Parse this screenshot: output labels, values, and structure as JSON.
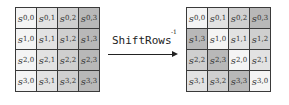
{
  "diagram": {
    "operation_label": "ShiftRows",
    "operation_superscript": "-1",
    "shades": {
      "0": "#f4f4f4",
      "1": "#e2e2e2",
      "2": "#cfcfcf",
      "3": "#b8b8b8"
    },
    "left_grid": {
      "cells": [
        [
          {
            "r": "0",
            "c": "0",
            "shade": 0
          },
          {
            "r": "0",
            "c": "1",
            "shade": 1
          },
          {
            "r": "0",
            "c": "2",
            "shade": 2
          },
          {
            "r": "0",
            "c": "3",
            "shade": 3
          }
        ],
        [
          {
            "r": "1",
            "c": "0",
            "shade": 0
          },
          {
            "r": "1",
            "c": "1",
            "shade": 1
          },
          {
            "r": "1",
            "c": "2",
            "shade": 2
          },
          {
            "r": "1",
            "c": "3",
            "shade": 3
          }
        ],
        [
          {
            "r": "2",
            "c": "0",
            "shade": 0
          },
          {
            "r": "2",
            "c": "1",
            "shade": 1
          },
          {
            "r": "2",
            "c": "2",
            "shade": 2
          },
          {
            "r": "2",
            "c": "3",
            "shade": 3
          }
        ],
        [
          {
            "r": "3",
            "c": "0",
            "shade": 0
          },
          {
            "r": "3",
            "c": "1",
            "shade": 1
          },
          {
            "r": "3",
            "c": "2",
            "shade": 2
          },
          {
            "r": "3",
            "c": "3",
            "shade": 3
          }
        ]
      ]
    },
    "right_grid": {
      "cells": [
        [
          {
            "r": "0",
            "c": "0",
            "shade": 0
          },
          {
            "r": "0",
            "c": "1",
            "shade": 1
          },
          {
            "r": "0",
            "c": "2",
            "shade": 2
          },
          {
            "r": "0",
            "c": "3",
            "shade": 3
          }
        ],
        [
          {
            "r": "1",
            "c": "3",
            "shade": 3
          },
          {
            "r": "1",
            "c": "0",
            "shade": 0
          },
          {
            "r": "1",
            "c": "1",
            "shade": 1
          },
          {
            "r": "1",
            "c": "2",
            "shade": 2
          }
        ],
        [
          {
            "r": "2",
            "c": "2",
            "shade": 2
          },
          {
            "r": "2",
            "c": "3",
            "shade": 3
          },
          {
            "r": "2",
            "c": "0",
            "shade": 0
          },
          {
            "r": "2",
            "c": "1",
            "shade": 1
          }
        ],
        [
          {
            "r": "3",
            "c": "1",
            "shade": 1
          },
          {
            "r": "3",
            "c": "2",
            "shade": 2
          },
          {
            "r": "3",
            "c": "3",
            "shade": 3
          },
          {
            "r": "3",
            "c": "0",
            "shade": 0
          }
        ]
      ]
    }
  }
}
